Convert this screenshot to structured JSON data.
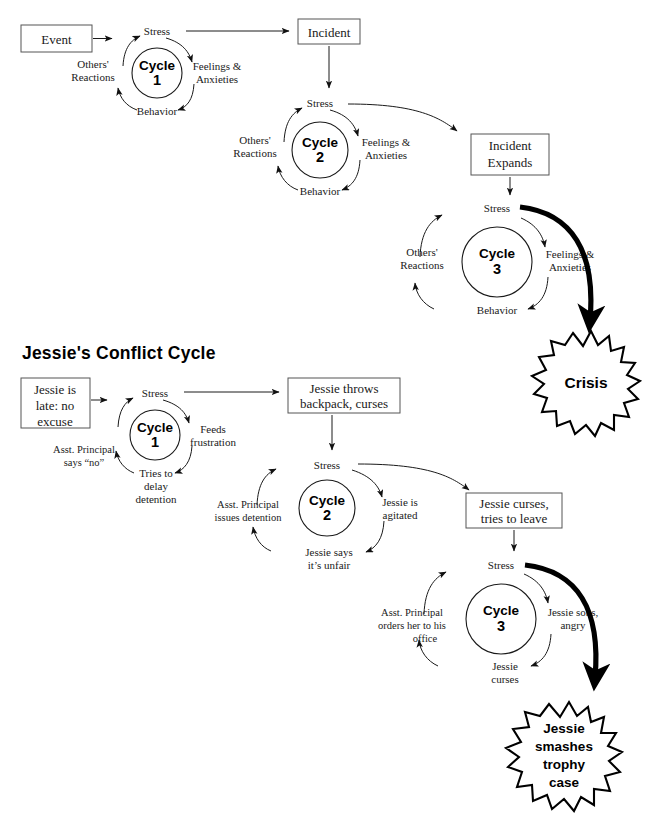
{
  "page": {
    "background": "#ffffff",
    "ink": "#1a1a1a",
    "width": 649,
    "height": 828
  },
  "diagrams": [
    {
      "id": "generic-conflict-cycle",
      "title": "",
      "boxes": [
        {
          "name": "event-box",
          "lines": [
            "Event"
          ]
        },
        {
          "name": "incident-box",
          "lines": [
            "Incident"
          ]
        },
        {
          "name": "incident-expands-box",
          "lines": [
            "Incident",
            "Expands"
          ]
        }
      ],
      "cycles": [
        {
          "name": "cycle-1",
          "center_label_word": "Cycle",
          "center_label_number": "1",
          "nodes": {
            "top": "Stress",
            "right": [
              "Feelings &",
              "Anxieties"
            ],
            "bottom": "Behavior",
            "left": [
              "Others'",
              "Reactions"
            ]
          }
        },
        {
          "name": "cycle-2",
          "center_label_word": "Cycle",
          "center_label_number": "2",
          "nodes": {
            "top": "Stress",
            "right": [
              "Feelings &",
              "Anxieties"
            ],
            "bottom": "Behavior",
            "left": [
              "Others'",
              "Reactions"
            ]
          }
        },
        {
          "name": "cycle-3",
          "center_label_word": "Cycle",
          "center_label_number": "3",
          "nodes": {
            "top": "Stress",
            "right": [
              "Feelings &",
              "Anxieties"
            ],
            "bottom": "Behavior",
            "left": [
              "Others'",
              "Reactions"
            ]
          }
        }
      ],
      "outcome": {
        "name": "crisis-burst",
        "lines": [
          "Crisis"
        ]
      }
    },
    {
      "id": "jessies-conflict-cycle",
      "title": "Jessie's Conflict Cycle",
      "boxes": [
        {
          "name": "jessie-late-box",
          "lines": [
            "Jessie is",
            "late: no",
            "excuse"
          ]
        },
        {
          "name": "jessie-throws-backpack-box",
          "lines": [
            "Jessie throws",
            "backpack, curses"
          ]
        },
        {
          "name": "jessie-curses-leave-box",
          "lines": [
            "Jessie curses,",
            "tries to leave"
          ]
        }
      ],
      "cycles": [
        {
          "name": "jessie-cycle-1",
          "center_label_word": "Cycle",
          "center_label_number": "1",
          "nodes": {
            "top": "Stress",
            "right": [
              "Feeds",
              "frustration"
            ],
            "bottom": [
              "Tries to",
              "delay",
              "detention"
            ],
            "left": [
              "Asst. Principal",
              "says “no”"
            ]
          }
        },
        {
          "name": "jessie-cycle-2",
          "center_label_word": "Cycle",
          "center_label_number": "2",
          "nodes": {
            "top": "Stress",
            "right": [
              "Jessie is",
              "agitated"
            ],
            "bottom": [
              "Jessie says",
              "it’s unfair"
            ],
            "left": [
              "Asst. Principal",
              "issues detention"
            ]
          }
        },
        {
          "name": "jessie-cycle-3",
          "center_label_word": "Cycle",
          "center_label_number": "3",
          "nodes": {
            "top": "Stress",
            "right": [
              "Jessie sobs,",
              "angry"
            ],
            "bottom": [
              "Jessie",
              "curses"
            ],
            "left": [
              "Asst. Principal",
              "orders her to his",
              "office"
            ]
          }
        }
      ],
      "outcome": {
        "name": "jessie-outcome-burst",
        "lines": [
          "Jessie",
          "smashes",
          "trophy",
          "case"
        ]
      }
    }
  ],
  "text": {
    "d1": {
      "event": "Event",
      "incident": "Incident",
      "incident_expands_1": "Incident",
      "incident_expands_2": "Expands",
      "c1_top": "Stress",
      "c1_right_1": "Feelings &",
      "c1_right_2": "Anxieties",
      "c1_bottom": "Behavior",
      "c1_left_1": "Others'",
      "c1_left_2": "Reactions",
      "c1_word": "Cycle",
      "c1_num": "1",
      "c2_top": "Stress",
      "c2_right_1": "Feelings &",
      "c2_right_2": "Anxieties",
      "c2_bottom": "Behavior",
      "c2_left_1": "Others'",
      "c2_left_2": "Reactions",
      "c2_word": "Cycle",
      "c2_num": "2",
      "c3_top": "Stress",
      "c3_right_1": "Feelings &",
      "c3_right_2": "Anxieties",
      "c3_bottom": "Behavior",
      "c3_left_1": "Others'",
      "c3_left_2": "Reactions",
      "c3_word": "Cycle",
      "c3_num": "3",
      "crisis": "Crisis"
    },
    "d2": {
      "title": "Jessie's Conflict Cycle",
      "box1_1": "Jessie is",
      "box1_2": "late: no",
      "box1_3": "excuse",
      "box2_1": "Jessie throws",
      "box2_2": "backpack, curses",
      "box3_1": "Jessie curses,",
      "box3_2": "tries to leave",
      "c1_top": "Stress",
      "c1_right_1": "Feeds",
      "c1_right_2": "frustration",
      "c1_bottom_1": "Tries to",
      "c1_bottom_2": "delay",
      "c1_bottom_3": "detention",
      "c1_left_1": "Asst. Principal",
      "c1_left_2": "says “no”",
      "c1_word": "Cycle",
      "c1_num": "1",
      "c2_top": "Stress",
      "c2_right_1": "Jessie is",
      "c2_right_2": "agitated",
      "c2_bottom_1": "Jessie says",
      "c2_bottom_2": "it’s unfair",
      "c2_left_1": "Asst. Principal",
      "c2_left_2": "issues detention",
      "c2_word": "Cycle",
      "c2_num": "2",
      "c3_top": "Stress",
      "c3_right_1": "Jessie sobs,",
      "c3_right_2": "angry",
      "c3_bottom_1": "Jessie",
      "c3_bottom_2": "curses",
      "c3_left_1": "Asst. Principal",
      "c3_left_2": "orders her to his",
      "c3_left_3": "office",
      "c3_word": "Cycle",
      "c3_num": "3",
      "burst_1": "Jessie",
      "burst_2": "smashes",
      "burst_3": "trophy",
      "burst_4": "case"
    }
  }
}
